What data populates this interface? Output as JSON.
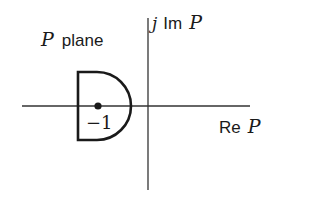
{
  "diagram": {
    "plane_label": {
      "var": "P",
      "text": "plane"
    },
    "imag_axis_label": {
      "prefix": "j",
      "text": "Im",
      "var": "P"
    },
    "real_axis_label": {
      "text": "Re",
      "var": "P"
    },
    "point_label": "−1",
    "colors": {
      "stroke": "#1a1a1a",
      "axis": "#333333",
      "background": "#ffffff"
    }
  }
}
